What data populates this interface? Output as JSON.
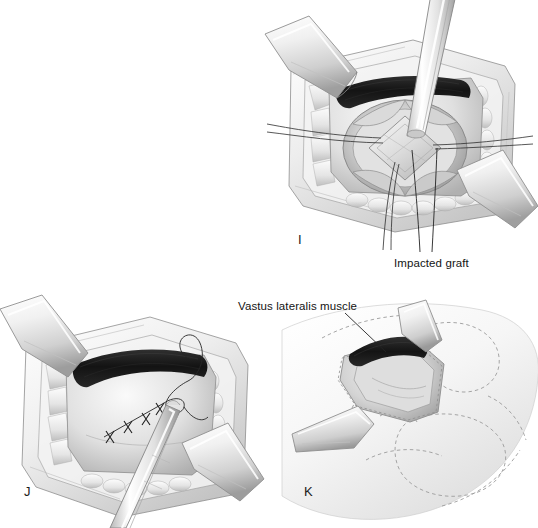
{
  "figure": {
    "background_color": "#ffffff",
    "width": 538,
    "height": 528,
    "medium": "grayscale pen-and-ink / airbrush medical illustration",
    "panel_count": 3
  },
  "palette": {
    "background": "#ffffff",
    "ink_line": "#2a2a2a",
    "muscle_dark": "#1d1d1d",
    "bone_light": "#e9e9e9",
    "bone_mid": "#cfcfcf",
    "bone_shadow": "#a9a9a9",
    "tissue_light": "#f1f1f1",
    "tissue_mid": "#dcdcdc",
    "tissue_shadow": "#b4b4b4",
    "instrument_light": "#fbfbfb",
    "instrument_mid": "#dedede",
    "instrument_shadow": "#9c9c9c",
    "suture_ink": "#262626",
    "label_text": "#141414",
    "dashed_outline": "#9a9a9a"
  },
  "panels": [
    {
      "id": "panel-i",
      "letter": "I",
      "letter_x": 298,
      "letter_y": 232,
      "caption_region": "upper-right",
      "description": "Surgical exposure of the acetabulum with impacted bone graft seated in the socket; a straight impactor rod is driven into the graft; two Hohmann-style retractors hold the wound open and a dark muscle band lies along the superior margin.",
      "contents": [
        "wound-retractor-upper-left",
        "wound-retractor-lower-right",
        "impactor-rod",
        "impacted-graft",
        "acetabular-socket",
        "dark-muscle-band",
        "skin-edge-frame"
      ],
      "labels": [
        "impacted-graft"
      ]
    },
    {
      "id": "panel-j",
      "letter": "J",
      "letter_x": 24,
      "letter_y": 490,
      "caption_region": "lower-left",
      "description": "Closure of the capsule / fascial layer with interrupted sutures; a needle holder grasps the curved needle while the suture strand loops across the wound; two retractors remain in place.",
      "contents": [
        "wound-retractor-upper-left",
        "wound-retractor-lower-right",
        "needle-holder",
        "suture-line",
        "suture-knots",
        "dark-muscle-band",
        "skin-edge-frame"
      ],
      "labels": []
    },
    {
      "id": "panel-k",
      "letter": "K",
      "letter_x": 304,
      "letter_y": 490,
      "caption_region": "lower-right",
      "description": "Completed closure shown in relation to surface anatomy; the vastus lateralis muscle is indicated by a leader line, with dashed contour lines marking the underlying muscle groups of the thigh and hip.",
      "contents": [
        "wound-retractor-upper",
        "wound-retractor-lower",
        "dark-muscle-band",
        "surface-anatomy-dashed-contours",
        "skin-edge-frame"
      ],
      "labels": [
        "vastus-lateralis-muscle"
      ]
    }
  ],
  "annotations": [
    {
      "id": "impacted-graft",
      "text": "Impacted graft",
      "text_x": 394,
      "text_y": 258,
      "anchor_panel": "panel-i",
      "leader_lines": [
        {
          "x1": 420,
          "y1": 252,
          "x2": 412,
          "y2": 150
        },
        {
          "x1": 432,
          "y1": 252,
          "x2": 437,
          "y2": 148
        }
      ]
    },
    {
      "id": "vastus-lateralis-muscle",
      "text": "Vastus lateralis muscle",
      "text_x": 238,
      "text_y": 305,
      "anchor_panel": "panel-k",
      "leader_lines": [
        {
          "x1": 345,
          "y1": 316,
          "x2": 385,
          "y2": 352
        }
      ]
    }
  ]
}
